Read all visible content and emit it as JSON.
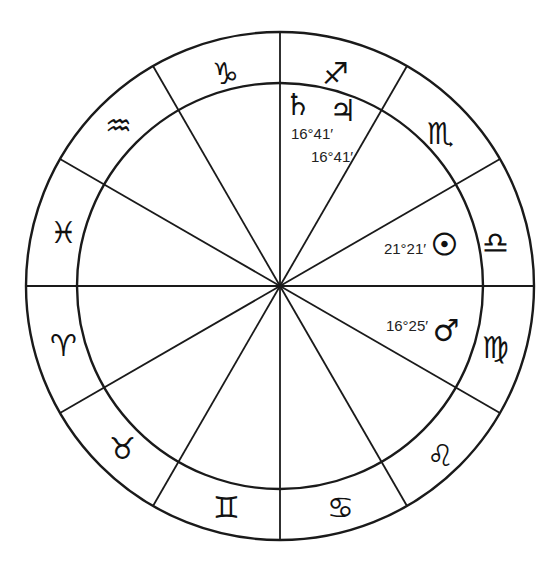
{
  "chart": {
    "center": {
      "x": 280,
      "y": 286
    },
    "outer_radius": 254,
    "inner_radius": 203,
    "line_color": "#1a1a1a",
    "spoke_angles_deg": [
      0,
      30,
      60,
      90,
      120,
      150,
      180,
      210,
      240,
      270,
      300,
      330
    ]
  },
  "signs": [
    {
      "name": "Libra",
      "glyph": "♎",
      "x": 495,
      "y": 242
    },
    {
      "name": "Scorpio",
      "glyph": "♏",
      "x": 440,
      "y": 133
    },
    {
      "name": "Sagittarius",
      "glyph": "♐",
      "x": 335,
      "y": 73
    },
    {
      "name": "Capricorn",
      "glyph": "♑",
      "x": 225,
      "y": 73
    },
    {
      "name": "Aquarius",
      "glyph": "♒",
      "x": 118,
      "y": 125
    },
    {
      "name": "Pisces",
      "glyph": "♓",
      "x": 63,
      "y": 232
    },
    {
      "name": "Aries",
      "glyph": "♈",
      "x": 63,
      "y": 345
    },
    {
      "name": "Taurus",
      "glyph": "♉",
      "x": 122,
      "y": 448
    },
    {
      "name": "Gemini",
      "glyph": "♊",
      "x": 226,
      "y": 507
    },
    {
      "name": "Cancer",
      "glyph": "♋",
      "x": 340,
      "y": 507
    },
    {
      "name": "Leo",
      "glyph": "♌",
      "x": 440,
      "y": 455
    },
    {
      "name": "Virgo",
      "glyph": "♍",
      "x": 495,
      "y": 347
    }
  ],
  "planets": [
    {
      "name": "Saturn",
      "glyph": "♄",
      "x": 298,
      "y": 104,
      "degree": "16°41′",
      "label_x": 312,
      "label_y": 133
    },
    {
      "name": "Jupiter",
      "glyph": "♃",
      "x": 343,
      "y": 110,
      "degree": "16°41′",
      "label_x": 332,
      "label_y": 156
    },
    {
      "name": "Sun",
      "glyph": "☉",
      "x": 444,
      "y": 244,
      "degree": "21°21′",
      "label_x": 405,
      "label_y": 248
    },
    {
      "name": "Mars",
      "glyph": "♂",
      "x": 446,
      "y": 330,
      "degree": "16°25′",
      "label_x": 407,
      "label_y": 325
    }
  ]
}
